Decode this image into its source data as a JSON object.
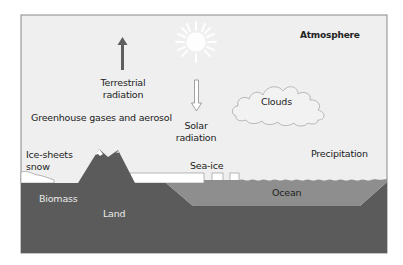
{
  "diagram": {
    "colors": {
      "sky": "#efefef",
      "frame": "#8a8a8a",
      "land": "#5b5b5b",
      "ocean": "#8e8e8e",
      "ice": "#ffffff",
      "terrestrial_arrow": "#5e5e5e"
    },
    "labels": {
      "atmosphere": "Atmosphere",
      "terrestrial_line1": "Terrestrial",
      "terrestrial_line2": "radiation",
      "solar_line1": "Solar",
      "solar_line2": "radiation",
      "clouds": "Clouds",
      "greenhouse": "Greenhouse gases and aerosol",
      "ice_sheets_line1": "Ice-sheets",
      "ice_sheets_line2": "snow",
      "sea_ice": "Sea-ice",
      "precipitation": "Precipitation",
      "biomass": "Biomass",
      "land": "Land",
      "ocean": "Ocean"
    },
    "icons": {
      "sun": "sun-icon",
      "terrestrial_arrow": "arrow-up-icon",
      "solar_arrow": "arrow-down-icon",
      "cloud": "cloud-icon",
      "mountain": "mountain-icon"
    }
  }
}
